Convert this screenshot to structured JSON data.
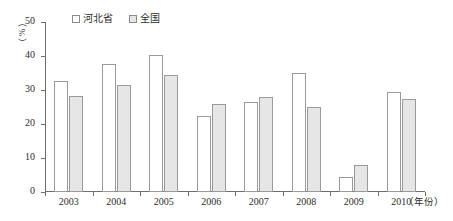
{
  "chart_data": {
    "type": "bar",
    "title": "",
    "subtitle": "",
    "xlabel": "（年份）",
    "ylabel": "（%）",
    "categories": [
      "2003",
      "2004",
      "2005",
      "2006",
      "2007",
      "2008",
      "2009",
      "2010"
    ],
    "series": [
      {
        "name": "河北省",
        "color": "#ffffff",
        "values": [
          32.6,
          37.6,
          40.3,
          22.4,
          26.5,
          35.1,
          4.4,
          29.4
        ]
      },
      {
        "name": "全国",
        "color": "#e6e6e6",
        "values": [
          28.2,
          31.6,
          34.4,
          25.8,
          28.0,
          25.1,
          8.0,
          27.3
        ]
      }
    ],
    "ylim": [
      0,
      50
    ],
    "yticks": [
      "0",
      "10",
      "20",
      "30",
      "40",
      "50"
    ],
    "grid": false,
    "legend_position": "top-left"
  },
  "legend": {
    "entries": [
      {
        "label": "河北省",
        "swatch": "white-square-icon"
      },
      {
        "label": "全国",
        "swatch": "gray-square-icon"
      }
    ]
  },
  "axes": {
    "y_unit_open_paren": "（",
    "y_unit_symbol": "%",
    "y_unit_close_paren": "）",
    "x_axis_title": "（年份）"
  }
}
